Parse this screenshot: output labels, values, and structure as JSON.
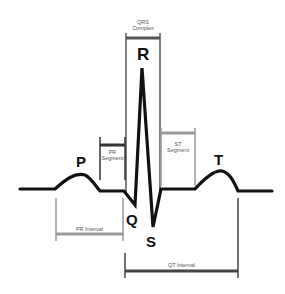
{
  "diagram": {
    "type": "ecg-waveform",
    "wave_labels": {
      "p": "P",
      "q": "Q",
      "r": "R",
      "s": "S",
      "t": "T"
    },
    "segment_labels": {
      "qrs_complex_line1": "QRS",
      "qrs_complex_line2": "Complex",
      "pr_segment_line1": "PR",
      "pr_segment_line2": "Segment",
      "st_segment_line1": "ST",
      "st_segment_line2": "Segment",
      "pr_interval": "PR Interval",
      "qt_interval": "QT Interval"
    },
    "colors": {
      "waveform": "#111111",
      "bracket_dark": "#444444",
      "bracket_light": "#999999"
    }
  }
}
